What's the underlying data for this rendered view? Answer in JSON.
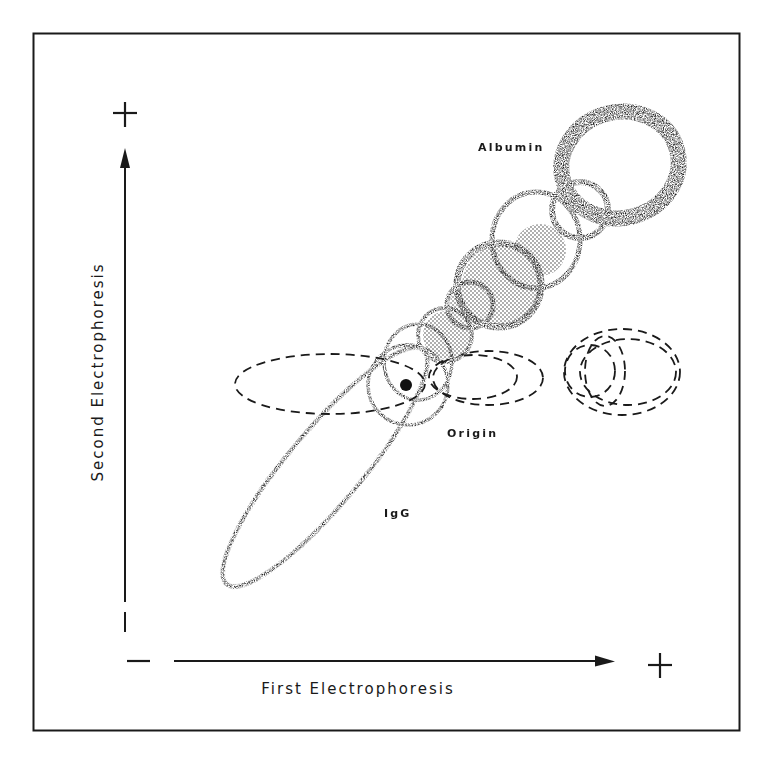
{
  "figure": {
    "type": "two-dimensional immunoelectrophoresis schematic",
    "frame": true
  },
  "axes": {
    "x": {
      "label": "First Electrophoresis",
      "negative_sign": "−",
      "positive_sign": "+",
      "direction": "left-to-right"
    },
    "y": {
      "label": "Second Electrophoresis",
      "negative_sign": "−",
      "positive_sign": "+",
      "direction": "bottom-to-top"
    }
  },
  "annotations": {
    "albumin": "Albumin",
    "origin": "Origin",
    "igg": "IgG"
  },
  "colors": {
    "ink": "#1a1a1a",
    "stipple": "#2a2a2a",
    "shade": "#b8b8b8",
    "background": "#ffffff"
  },
  "legend_styles": {
    "stippled_ring": "precipitin arc (second dimension)",
    "shaded_disc": "dense precipitate zone",
    "dashed_ellipse": "first-dimension separation zones",
    "filled_dot": "sample origin"
  }
}
